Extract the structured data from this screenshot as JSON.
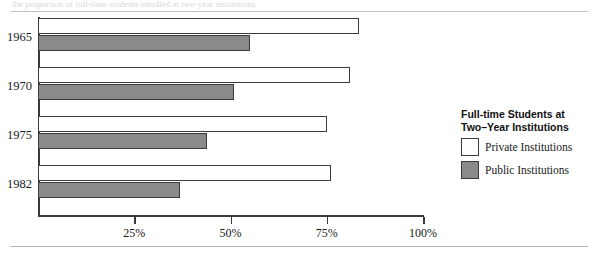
{
  "figure": {
    "caption_sliver": "the proportion of full-time students enrolled at two-year institutions"
  },
  "legend": {
    "title_line1": "Full-time Students at",
    "title_line2": "Two–Year Institutions",
    "entries": [
      {
        "label": "Private Institutions",
        "color": "#ffffff",
        "key": "private"
      },
      {
        "label": "Public Institutions",
        "color": "#8a8a8a",
        "key": "public"
      }
    ]
  },
  "colors": {
    "private_fill": "#ffffff",
    "public_fill": "#8a8a8a",
    "outline": "#3c3c3c",
    "axis": "#3a3a3a",
    "rule": "#b9b9b9"
  },
  "chart_data": {
    "type": "bar",
    "orientation": "horizontal",
    "title": "",
    "xlabel": "",
    "ylabel": "",
    "categories": [
      "1965",
      "1970",
      "1975",
      "1982"
    ],
    "series": [
      {
        "name": "Private Institutions",
        "values": [
          83.5,
          81,
          75,
          76
        ]
      },
      {
        "name": "Public Institutions",
        "values": [
          55,
          51,
          44,
          37
        ]
      }
    ],
    "xlim": [
      0,
      100
    ],
    "xticks": [
      25,
      50,
      75,
      100
    ],
    "xtick_labels": [
      "25%",
      "50%",
      "75%",
      "100%"
    ],
    "grid": false,
    "legend_position": "right"
  }
}
